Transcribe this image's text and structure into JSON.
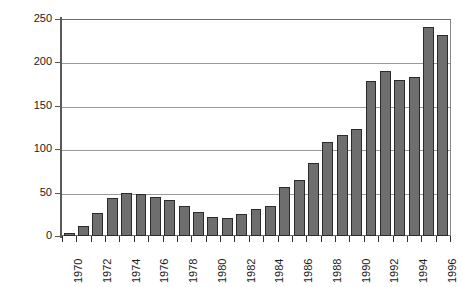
{
  "chart_data": {
    "type": "bar",
    "title": "",
    "subtitle": "",
    "xlabel": "",
    "ylabel": "",
    "ylim": [
      0,
      250
    ],
    "yticks": [
      0,
      50,
      100,
      150,
      200,
      250
    ],
    "ytick_labels": [
      "0",
      "50",
      "100",
      "150",
      "200",
      "250"
    ],
    "grid": true,
    "legend": "none",
    "categories": [
      "1970",
      "1971",
      "1972",
      "1973",
      "1974",
      "1975",
      "1976",
      "1977",
      "1978",
      "1979",
      "1980",
      "1981",
      "1982",
      "1983",
      "1984",
      "1985",
      "1986",
      "1987",
      "1988",
      "1989",
      "1990",
      "1991",
      "1992",
      "1993",
      "1994",
      "1995",
      "1996"
    ],
    "xtick_labels": [
      "1970",
      "1972",
      "1974",
      "1976",
      "1978",
      "1980",
      "1982",
      "1984",
      "1986",
      "1988",
      "1990",
      "1992",
      "1994",
      "1996"
    ],
    "values": [
      4,
      12,
      27,
      44,
      50,
      48,
      45,
      42,
      35,
      28,
      22,
      21,
      25,
      31,
      35,
      56,
      65,
      84,
      108,
      116,
      123,
      179,
      190,
      180,
      183,
      241,
      232
    ],
    "bar_color": "#6e6e6e",
    "bar_edge_color": "#2b2b2b",
    "grid_color": "#9a9a9a",
    "axis_color": "#595959",
    "background_color": "#ffffff"
  }
}
